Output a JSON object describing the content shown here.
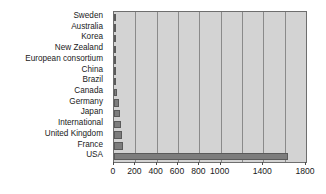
{
  "chart_data": {
    "type": "bar",
    "orientation": "horizontal",
    "title": "",
    "xlabel": "",
    "ylabel": "",
    "xlim": [
      0,
      1800
    ],
    "grid": true,
    "legend": false,
    "gridlines": [
      200,
      400,
      600,
      800,
      1000,
      1200,
      1400,
      1600
    ],
    "tick_values": [
      0,
      200,
      400,
      600,
      800,
      1000,
      1400,
      1800
    ],
    "tick_labels": [
      "0",
      "200",
      "400",
      "600",
      "800",
      "1000",
      "1400",
      "1800"
    ],
    "categories": [
      "Sweden",
      "Australia",
      "Korea",
      "New Zealand",
      "European consortium",
      "China",
      "Brazil",
      "Canada",
      "Germany",
      "Japan",
      "International",
      "United Kingdom",
      "France",
      "USA"
    ],
    "values": [
      6,
      8,
      10,
      12,
      14,
      18,
      22,
      30,
      45,
      55,
      65,
      75,
      85,
      1630
    ],
    "colors": {
      "bar_fill": "#7d7d7d",
      "bar_edge": "#5a5a5a",
      "plot_background": "#d3d3d3",
      "grid_color": "#8a8a8a",
      "axis_color": "#6e6e6e",
      "text_color": "#1a1a1a",
      "figure_background": "#ffffff"
    }
  }
}
